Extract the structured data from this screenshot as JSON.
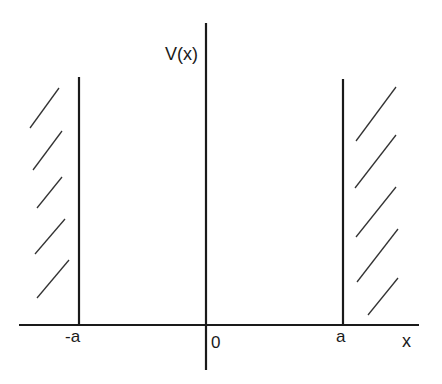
{
  "diagram": {
    "labels": {
      "y_axis": "V(x)",
      "x_axis": "x",
      "origin": "0",
      "left_wall": "-a",
      "right_wall": "a"
    },
    "colors": {
      "line": "#1a1a1a",
      "hatch": "#333333",
      "background": "#ffffff"
    },
    "geometry": {
      "x_axis_y": 325,
      "x_axis_from": 19,
      "x_axis_to": 419,
      "y_axis_x": 206,
      "y_axis_from": 23,
      "y_axis_to": 370,
      "left_wall_x": 79,
      "left_wall_top": 77,
      "right_wall_x": 343,
      "right_wall_top": 79
    },
    "left_hatches": [
      [
        30,
        128,
        59,
        88
      ],
      [
        33,
        170,
        62,
        131
      ],
      [
        37,
        208,
        62,
        177
      ],
      [
        35,
        254,
        65,
        219
      ],
      [
        37,
        298,
        69,
        260
      ]
    ],
    "right_hatches": [
      [
        356,
        141,
        396,
        87
      ],
      [
        355,
        188,
        396,
        135
      ],
      [
        356,
        237,
        396,
        187
      ],
      [
        357,
        282,
        398,
        229
      ],
      [
        368,
        315,
        398,
        278
      ]
    ]
  }
}
